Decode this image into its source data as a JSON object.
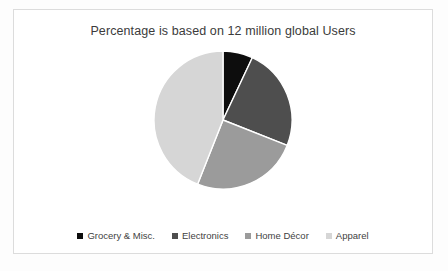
{
  "chart": {
    "title": "Percentage is based on 12 million global Users",
    "legend_position": "bottom"
  },
  "legend": {
    "items": [
      {
        "label": "Grocery & Misc.",
        "color": "#0d0d0d",
        "marker": "square-marker"
      },
      {
        "label": "Electronics",
        "color": "#4e4e4e",
        "marker": "square-marker"
      },
      {
        "label": "Home Décor",
        "color": "#9b9b9b",
        "marker": "square-marker"
      },
      {
        "label": "Apparel",
        "color": "#d6d6d6",
        "marker": "square-marker"
      }
    ]
  },
  "chart_data": {
    "type": "pie",
    "title": "Percentage is based on 12 million global Users",
    "xlabel": "",
    "ylabel": "",
    "categories": [
      "Grocery & Misc.",
      "Electronics",
      "Home Décor",
      "Apparel"
    ],
    "values": [
      7,
      24,
      25,
      44
    ],
    "units": "percent",
    "total_users": "12 million global Users",
    "colors": [
      "#0d0d0d",
      "#4e4e4e",
      "#9b9b9b",
      "#d6d6d6"
    ],
    "slice_border_color": "#ffffff",
    "start_angle_deg": 0,
    "direction": "clockwise",
    "legend": [
      "Grocery & Misc.",
      "Electronics",
      "Home Décor",
      "Apparel"
    ],
    "legend_position": "bottom",
    "grid": false,
    "data_labels": false
  }
}
